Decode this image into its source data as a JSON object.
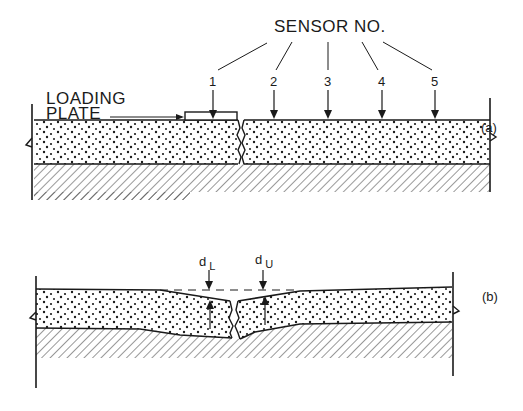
{
  "figure": {
    "panel_a": {
      "tag": "(a)",
      "sensor_heading": "SENSOR NO.",
      "loading_plate_label_line1": "LOADING",
      "loading_plate_label_line2": "PLATE",
      "sensors": [
        "1",
        "2",
        "3",
        "4",
        "5"
      ]
    },
    "panel_b": {
      "tag": "(b)",
      "deflection_loaded_label": "d",
      "deflection_loaded_sub": "L",
      "deflection_unloaded_label": "d",
      "deflection_unloaded_sub": "U"
    },
    "colors": {
      "ink": "#1a1a1a",
      "background": "#ffffff"
    }
  }
}
